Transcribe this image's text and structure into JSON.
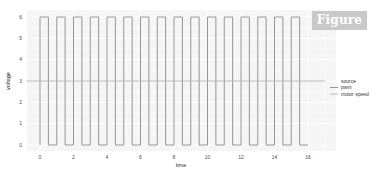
{
  "badge": {
    "label": "Figure 1"
  },
  "chart_data": {
    "type": "line",
    "title": "",
    "xlabel": "time",
    "ylabel": "voltage",
    "xlim": [
      -0.8,
      17.0
    ],
    "ylim": [
      -0.3,
      6.3
    ],
    "x_ticks": [
      0,
      2,
      4,
      6,
      8,
      10,
      12,
      14,
      16
    ],
    "y_ticks": [
      0,
      1,
      2,
      3,
      4,
      5,
      6
    ],
    "grid": true,
    "legend": {
      "title": "source",
      "position": "right",
      "entries": [
        "pwm",
        "motor speed"
      ]
    },
    "series": [
      {
        "name": "pwm",
        "color": "#8a8a8a",
        "kind": "square_wave",
        "period": 1.0,
        "duty_cycle": 0.5,
        "high": 6,
        "low": 0,
        "t_start": 0,
        "t_end": 16
      },
      {
        "name": "motor speed",
        "color": "#b0b0b0",
        "kind": "constant",
        "value": 3,
        "t_start": -0.8,
        "t_end": 17.0
      }
    ]
  }
}
